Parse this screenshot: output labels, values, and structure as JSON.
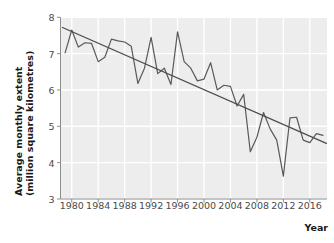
{
  "chart_data": {
    "type": "line",
    "title": "",
    "xlabel": "Year",
    "ylabel": "Average monthly extent (million square kilometres)",
    "ylabel_line1": "Average monthly extent",
    "ylabel_line2": "(million square kilometres)",
    "xlim": [
      1978.3,
      2018.6
    ],
    "ylim": [
      3,
      8
    ],
    "xticks": [
      1980,
      1984,
      1988,
      1992,
      1996,
      2000,
      2004,
      2008,
      2012,
      2016
    ],
    "xtick_labels": [
      "1980",
      "1984",
      "1988",
      "1992",
      "1996",
      "2000",
      "2004",
      "2008",
      "2012",
      "2016"
    ],
    "yticks": [
      3,
      4,
      5,
      6,
      7,
      8
    ],
    "ytick_labels": [
      "3",
      "4",
      "5",
      "6",
      "7",
      "8"
    ],
    "grid": true,
    "legend": "none",
    "plot_bg": "#ededed",
    "grid_color": "#ffffff",
    "line_color": "#595959",
    "trend_color": "#4d4d4d",
    "series": [
      {
        "name": "Average monthly sea ice extent",
        "x": [
          1979,
          1980,
          1981,
          1982,
          1983,
          1984,
          1985,
          1986,
          1987,
          1988,
          1989,
          1990,
          1991,
          1992,
          1993,
          1994,
          1995,
          1996,
          1997,
          1998,
          1999,
          2000,
          2001,
          2002,
          2003,
          2004,
          2005,
          2006,
          2007,
          2008,
          2009,
          2010,
          2011,
          2012,
          2013,
          2014,
          2015,
          2016,
          2017,
          2018
        ],
        "values": [
          7.02,
          7.65,
          7.18,
          7.3,
          7.28,
          6.78,
          6.9,
          7.4,
          7.35,
          7.32,
          7.2,
          6.18,
          6.6,
          7.45,
          6.45,
          6.6,
          6.15,
          7.6,
          6.78,
          6.6,
          6.25,
          6.3,
          6.75,
          6.0,
          6.13,
          6.1,
          5.56,
          5.88,
          4.3,
          4.7,
          5.38,
          4.93,
          4.62,
          3.63,
          5.23,
          5.25,
          4.62,
          4.55,
          4.8,
          4.75
        ]
      },
      {
        "name": "Linear trend",
        "type": "trend",
        "x": [
          1978.6,
          2018.5
        ],
        "values": [
          7.72,
          4.53
        ]
      }
    ]
  }
}
